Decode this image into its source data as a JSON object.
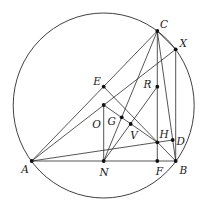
{
  "diagram": {
    "colors": {
      "line": "#2b2b2b",
      "point": "#111111",
      "label": "#1a1a1a",
      "background": "#ffffff"
    },
    "circle": {
      "name": "circumcircle",
      "cx": 103.7,
      "cy": 105.5,
      "rx": 90.5,
      "ry": 92.5
    },
    "points": [
      {
        "id": "A",
        "label": "A",
        "x": 31.7,
        "y": 161.0,
        "lx": 25.0,
        "ly": 169.0
      },
      {
        "id": "B",
        "label": "B",
        "x": 175.7,
        "y": 161.0,
        "lx": 183.3,
        "ly": 169.5
      },
      {
        "id": "C",
        "label": "C",
        "x": 157.3,
        "y": 31.0,
        "lx": 164.0,
        "ly": 24.0
      },
      {
        "id": "D",
        "label": "D",
        "x": 172.7,
        "y": 140.0,
        "lx": 180.7,
        "ly": 141.0
      },
      {
        "id": "E",
        "label": "E",
        "x": 103.7,
        "y": 86.7,
        "lx": 97.0,
        "ly": 80.5
      },
      {
        "id": "F",
        "label": "F",
        "x": 157.3,
        "y": 161.0,
        "lx": 159.3,
        "ly": 171.0
      },
      {
        "id": "G",
        "label": "G",
        "x": 121.7,
        "y": 117.3,
        "lx": 111.7,
        "ly": 121.0
      },
      {
        "id": "H",
        "label": "H",
        "x": 157.3,
        "y": 142.3,
        "lx": 164.0,
        "ly": 134.0
      },
      {
        "id": "N",
        "label": "N",
        "x": 103.7,
        "y": 161.0,
        "lx": 104.0,
        "ly": 172.0
      },
      {
        "id": "O",
        "label": "O",
        "x": 103.7,
        "y": 105.0,
        "lx": 96.5,
        "ly": 123.5
      },
      {
        "id": "R",
        "label": "R",
        "x": 157.3,
        "y": 86.7,
        "lx": 147.5,
        "ly": 84.0
      },
      {
        "id": "V",
        "label": "V",
        "x": 130.7,
        "y": 124.0,
        "lx": 134.0,
        "ly": 135.0
      },
      {
        "id": "X",
        "label": "X",
        "x": 175.7,
        "y": 49.3,
        "lx": 183.3,
        "ly": 42.5
      }
    ],
    "segments": [
      [
        "A",
        "B"
      ],
      [
        "A",
        "C"
      ],
      [
        "A",
        "X"
      ],
      [
        "A",
        "D"
      ],
      [
        "C",
        "X"
      ],
      [
        "X",
        "B"
      ],
      [
        "C",
        "B"
      ],
      [
        "C",
        "F"
      ],
      [
        "C",
        "N"
      ],
      [
        "R",
        "N"
      ],
      [
        "O",
        "N"
      ],
      [
        "O",
        "H"
      ],
      [
        "E",
        "B"
      ]
    ]
  }
}
